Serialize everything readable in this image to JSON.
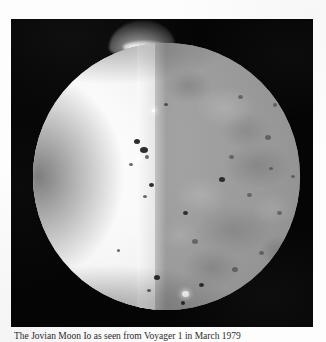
{
  "page": {
    "background_color": "#fdfdfd",
    "kind": "scanned-book-page"
  },
  "figure": {
    "frame_color": "#050505",
    "caption": "The Jovian Moon Io as seen from Voyager 1 in March 1979",
    "subject_name": "Io",
    "body": {
      "lit_hemisphere_color": "#fafafa",
      "dark_hemisphere_color": "#9a9a9a",
      "terminator_label": "terminator"
    },
    "plume": {
      "label": "volcanic-plume",
      "color": "#d7d7d7"
    },
    "features": {
      "dark_spots_label": "volcanic-patera",
      "bright_spot_label": "bright-eruption-spot",
      "dark_spots": [
        {
          "x": 101,
          "y": 96,
          "w": 6,
          "h": 5,
          "style": "spot"
        },
        {
          "x": 107,
          "y": 104,
          "w": 8,
          "h": 6,
          "style": "spot"
        },
        {
          "x": 112,
          "y": 112,
          "w": 4,
          "h": 4,
          "style": "soft"
        },
        {
          "x": 96,
          "y": 120,
          "w": 4,
          "h": 3,
          "style": "soft"
        },
        {
          "x": 116,
          "y": 140,
          "w": 5,
          "h": 4,
          "style": "spot"
        },
        {
          "x": 110,
          "y": 152,
          "w": 4,
          "h": 3,
          "style": "soft"
        },
        {
          "x": 121,
          "y": 232,
          "w": 6,
          "h": 5,
          "style": "spot"
        },
        {
          "x": 114,
          "y": 246,
          "w": 4,
          "h": 3,
          "style": "soft"
        },
        {
          "x": 84,
          "y": 206,
          "w": 3,
          "h": 3,
          "style": "soft"
        },
        {
          "x": 131,
          "y": 60,
          "w": 4,
          "h": 3,
          "style": "soft"
        },
        {
          "x": 205,
          "y": 52,
          "w": 5,
          "h": 4,
          "style": "gray"
        },
        {
          "x": 232,
          "y": 92,
          "w": 6,
          "h": 5,
          "style": "gray"
        },
        {
          "x": 240,
          "y": 60,
          "w": 4,
          "h": 4,
          "style": "gray"
        },
        {
          "x": 196,
          "y": 112,
          "w": 5,
          "h": 4,
          "style": "gray"
        },
        {
          "x": 186,
          "y": 134,
          "w": 6,
          "h": 5,
          "style": "spot"
        },
        {
          "x": 214,
          "y": 150,
          "w": 5,
          "h": 4,
          "style": "gray"
        },
        {
          "x": 244,
          "y": 168,
          "w": 5,
          "h": 4,
          "style": "gray"
        },
        {
          "x": 150,
          "y": 168,
          "w": 5,
          "h": 4,
          "style": "spot"
        },
        {
          "x": 159,
          "y": 196,
          "w": 6,
          "h": 5,
          "style": "gray"
        },
        {
          "x": 226,
          "y": 208,
          "w": 5,
          "h": 4,
          "style": "gray"
        },
        {
          "x": 199,
          "y": 224,
          "w": 6,
          "h": 5,
          "style": "gray"
        },
        {
          "x": 166,
          "y": 240,
          "w": 5,
          "h": 4,
          "style": "spot"
        },
        {
          "x": 178,
          "y": 262,
          "w": 4,
          "h": 4,
          "style": "gray"
        },
        {
          "x": 212,
          "y": 250,
          "w": 5,
          "h": 4,
          "style": "gray"
        },
        {
          "x": 236,
          "y": 124,
          "w": 4,
          "h": 3,
          "style": "gray"
        },
        {
          "x": 258,
          "y": 132,
          "w": 4,
          "h": 3,
          "style": "gray"
        },
        {
          "x": 148,
          "y": 258,
          "w": 4,
          "h": 4,
          "style": "spot"
        }
      ],
      "bright_spots": [
        {
          "x": 149,
          "y": 248,
          "w": 7,
          "h": 6
        },
        {
          "x": 104,
          "y": 114,
          "w": 3,
          "h": 3
        },
        {
          "x": 119,
          "y": 66,
          "w": 3,
          "h": 3
        }
      ]
    }
  }
}
